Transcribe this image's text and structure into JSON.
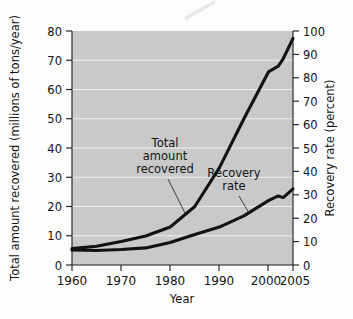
{
  "figure": {
    "background_color": "#fdfdfd",
    "plot_background_color": "#c9c9c9",
    "line_color": "#121212",
    "gridline_color": "#ffffff"
  },
  "chart_data": {
    "type": "line",
    "title": "",
    "xlabel": "Year",
    "ylabel": "Total amount recovered (millions of tons/year)",
    "y2label": "Recovery rate (percent)",
    "xlim": [
      1960,
      2005
    ],
    "ylim": [
      0,
      80
    ],
    "y2lim": [
      0,
      100
    ],
    "grid": true,
    "legend": "inline annotations",
    "xticks": [
      1960,
      1970,
      1980,
      1990,
      2000,
      2005
    ],
    "xticklabels": [
      "1960",
      "1970",
      "1980",
      "1990",
      "2000",
      "2005"
    ],
    "yticks": [
      0,
      10,
      20,
      30,
      40,
      50,
      60,
      70,
      80
    ],
    "yticklabels": [
      "0",
      "10",
      "20",
      "30",
      "40",
      "50",
      "60",
      "70",
      "80"
    ],
    "y2ticks": [
      0,
      10,
      20,
      30,
      40,
      50,
      60,
      70,
      80,
      90,
      100
    ],
    "y2ticklabels": [
      "0",
      "10",
      "20",
      "30",
      "40",
      "50",
      "60",
      "70",
      "80",
      "90",
      "100"
    ],
    "series": [
      {
        "name": "Total amount recovered",
        "axis": "left",
        "units": "millions of tons/year",
        "x": [
          1960,
          1965,
          1970,
          1975,
          1980,
          1985,
          1990,
          1995,
          2000,
          2002,
          2003,
          2005
        ],
        "values": [
          5.6,
          6.4,
          8.0,
          9.9,
          13.0,
          20.0,
          33.2,
          50.0,
          66.0,
          68.0,
          70.5,
          77.5
        ]
      },
      {
        "name": "Recovery rate",
        "axis": "right",
        "units": "percent",
        "x": [
          1960,
          1965,
          1970,
          1975,
          1980,
          1985,
          1990,
          1995,
          2000,
          2002,
          2003,
          2005
        ],
        "values": [
          6.4,
          6.2,
          6.6,
          7.3,
          9.6,
          13.0,
          16.2,
          21.0,
          27.5,
          29.5,
          28.8,
          32.5
        ]
      }
    ],
    "annotations": [
      {
        "name": "total-amount-recovered",
        "lines": [
          "Total",
          "amount",
          "recovered"
        ]
      },
      {
        "name": "recovery-rate",
        "lines": [
          "Recovery",
          "rate"
        ]
      }
    ]
  }
}
